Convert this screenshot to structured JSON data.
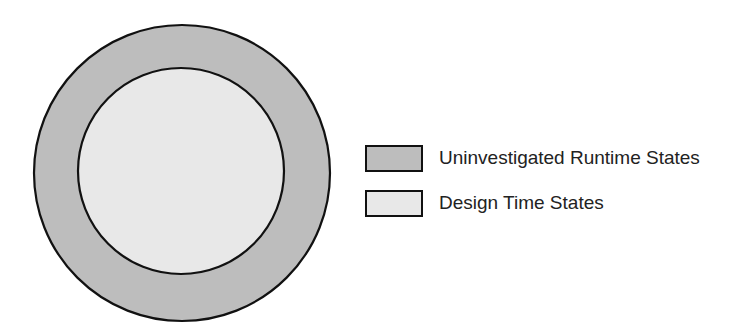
{
  "diagram": {
    "outer_circle": {
      "label": "Uninvestigated Runtime States",
      "fill": "#bdbdbd",
      "stroke": "#111111"
    },
    "inner_circle": {
      "label": "Design Time States",
      "fill": "#e8e8e8",
      "stroke": "#111111"
    }
  },
  "legend": {
    "items": [
      {
        "label": "Uninvestigated Runtime States",
        "color": "#bdbdbd"
      },
      {
        "label": "Design Time States",
        "color": "#e8e8e8"
      }
    ]
  }
}
